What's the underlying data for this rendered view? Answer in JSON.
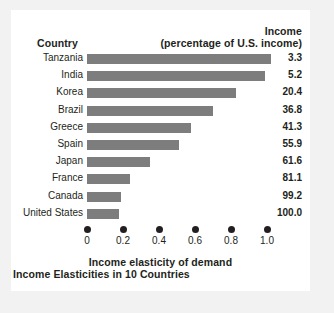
{
  "header": {
    "country_label": "Country",
    "income_line1": "Income",
    "income_line2": "(percentage of U.S. income)"
  },
  "caption": "Income Elasticities in 10 Countries",
  "colors": {
    "bar": "#7d7d7d",
    "text": "#231f20",
    "panel_background": "#ffffff",
    "frame_background": "#f2f2f2"
  },
  "chart_data": {
    "type": "bar",
    "orientation": "horizontal",
    "title": "Income Elasticities in 10 Countries",
    "xlabel": "Income elasticity of demand",
    "ylabel": "Country",
    "xlim": [
      0,
      1.0
    ],
    "grid": false,
    "legend": null,
    "xticks": [
      "0",
      "0.2",
      "0.4",
      "0.6",
      "0.8",
      "1.0"
    ],
    "xtick_values": [
      0,
      0.2,
      0.4,
      0.6,
      0.8,
      1.0
    ],
    "categories": [
      "Tanzania",
      "India",
      "Korea",
      "Brazil",
      "Greece",
      "Spain",
      "Japan",
      "France",
      "Canada",
      "United States"
    ],
    "values": [
      1.02,
      0.99,
      0.83,
      0.7,
      0.58,
      0.51,
      0.35,
      0.24,
      0.19,
      0.18
    ],
    "secondary_column": {
      "name": "Income (percentage of U.S. income)",
      "values": [
        "3.3",
        "5.2",
        "20.4",
        "36.8",
        "41.3",
        "55.9",
        "61.6",
        "81.1",
        "99.2",
        "100.0"
      ]
    }
  }
}
